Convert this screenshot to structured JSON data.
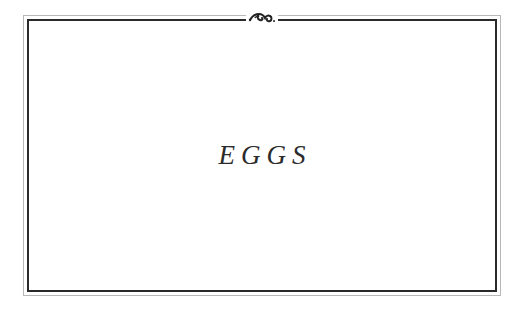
{
  "card": {
    "title": "EGGS",
    "ornament": "flourish-icon",
    "colors": {
      "frame_dark": "#2a2a2a",
      "frame_light": "#b8b8b8",
      "text": "#2b2b2b",
      "background": "#ffffff"
    }
  }
}
